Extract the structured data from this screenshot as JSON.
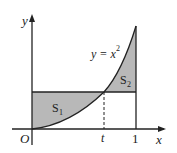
{
  "diagram": {
    "curve_label": "y = x",
    "curve_exponent": "2",
    "axis_x_label": "x",
    "axis_y_label": "y",
    "origin_label": "O",
    "t_label": "t",
    "one_label": "1",
    "region1_label": "S",
    "region1_sub": "1",
    "region2_label": "S",
    "region2_sub": "2",
    "colors": {
      "fill": "#b8b8b8",
      "stroke": "#222222",
      "background": "#ffffff"
    }
  }
}
